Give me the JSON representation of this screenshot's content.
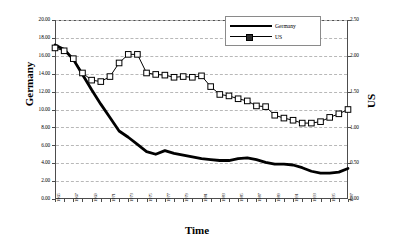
{
  "chart_data": {
    "type": "line",
    "title": "",
    "xlabel": "Time",
    "ylabel": "Germany",
    "y2label": "US",
    "grid": true,
    "legend_position": "top-right",
    "x": [
      1965,
      1966,
      1967,
      1968,
      1969,
      1970,
      1971,
      1972,
      1973,
      1974,
      1975,
      1976,
      1977,
      1978,
      1979,
      1980,
      1981,
      1982,
      1983,
      1984,
      1985,
      1986,
      1987,
      1988,
      1989,
      1990,
      1991,
      1992,
      1993,
      1994,
      1995,
      1996,
      1997
    ],
    "xtick_labels": [
      "1965",
      "1967",
      "1969",
      "1971",
      "1973",
      "1975",
      "1977",
      "1979",
      "1981",
      "1983",
      "1985",
      "1987",
      "1989",
      "1991",
      "1993",
      "1995",
      "1997"
    ],
    "ylim": [
      0,
      20
    ],
    "ytick_labels": [
      "0.00",
      "2.00",
      "4.00",
      "6.00",
      "8.00",
      "10.00",
      "12.00",
      "14.00",
      "16.00",
      "18.00",
      "20.00"
    ],
    "y2lim": [
      0,
      2.5
    ],
    "y2tick_labels": [
      "0.00",
      "0.50",
      "1.00",
      "1.50",
      "2.00",
      "2.50"
    ],
    "series": [
      {
        "name": "Germany",
        "axis": "left",
        "style": "thick-line",
        "color": "#000000",
        "values": [
          17.2,
          16.7,
          15.6,
          13.9,
          12.2,
          10.6,
          9.1,
          7.6,
          6.9,
          6.1,
          5.3,
          5.0,
          5.4,
          5.1,
          4.9,
          4.7,
          4.5,
          4.4,
          4.3,
          4.3,
          4.5,
          4.6,
          4.4,
          4.1,
          3.9,
          3.9,
          3.8,
          3.5,
          3.1,
          2.9,
          2.9,
          3.0,
          3.4
        ]
      },
      {
        "name": "US",
        "axis": "right",
        "style": "line-square-markers",
        "color": "#000000",
        "values": [
          2.11,
          2.07,
          1.96,
          1.76,
          1.66,
          1.64,
          1.71,
          1.9,
          2.02,
          2.02,
          1.76,
          1.74,
          1.73,
          1.7,
          1.71,
          1.7,
          1.72,
          1.57,
          1.46,
          1.44,
          1.4,
          1.37,
          1.3,
          1.29,
          1.17,
          1.13,
          1.1,
          1.06,
          1.06,
          1.08,
          1.14,
          1.19,
          1.25
        ]
      }
    ]
  },
  "legend": {
    "entries": [
      {
        "label": "Germany"
      },
      {
        "label": "US"
      }
    ]
  }
}
